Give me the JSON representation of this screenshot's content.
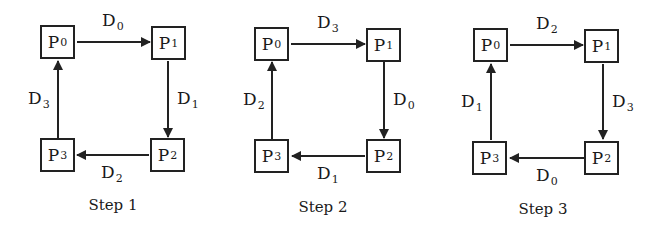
{
  "diagram": {
    "node_labels": [
      "P",
      "P",
      "P",
      "P"
    ],
    "panels": [
      {
        "caption": "Step 1",
        "nodes": [
          {
            "name": "P",
            "sub": "0"
          },
          {
            "name": "P",
            "sub": "1"
          },
          {
            "name": "P",
            "sub": "2"
          },
          {
            "name": "P",
            "sub": "3"
          }
        ],
        "edges": {
          "top": {
            "from": "P0",
            "to": "P1",
            "label": "D",
            "sub": "0"
          },
          "right": {
            "from": "P1",
            "to": "P2",
            "label": "D",
            "sub": "1"
          },
          "bottom": {
            "from": "P2",
            "to": "P3",
            "label": "D",
            "sub": "2"
          },
          "left": {
            "from": "P3",
            "to": "P0",
            "label": "D",
            "sub": "3"
          }
        }
      },
      {
        "caption": "Step 2",
        "nodes": [
          {
            "name": "P",
            "sub": "0"
          },
          {
            "name": "P",
            "sub": "1"
          },
          {
            "name": "P",
            "sub": "2"
          },
          {
            "name": "P",
            "sub": "3"
          }
        ],
        "edges": {
          "top": {
            "from": "P0",
            "to": "P1",
            "label": "D",
            "sub": "3"
          },
          "right": {
            "from": "P1",
            "to": "P2",
            "label": "D",
            "sub": "0"
          },
          "bottom": {
            "from": "P2",
            "to": "P3",
            "label": "D",
            "sub": "1"
          },
          "left": {
            "from": "P3",
            "to": "P0",
            "label": "D",
            "sub": "2"
          }
        }
      },
      {
        "caption": "Step 3",
        "nodes": [
          {
            "name": "P",
            "sub": "0"
          },
          {
            "name": "P",
            "sub": "1"
          },
          {
            "name": "P",
            "sub": "2"
          },
          {
            "name": "P",
            "sub": "3"
          }
        ],
        "edges": {
          "top": {
            "from": "P0",
            "to": "P1",
            "label": "D",
            "sub": "2"
          },
          "right": {
            "from": "P1",
            "to": "P2",
            "label": "D",
            "sub": "3"
          },
          "bottom": {
            "from": "P2",
            "to": "P3",
            "label": "D",
            "sub": "0"
          },
          "left": {
            "from": "P3",
            "to": "P0",
            "label": "D",
            "sub": "1"
          }
        }
      }
    ],
    "colors": {
      "stroke": "#222222",
      "background": "#ffffff",
      "text": "#1a1a1a"
    }
  }
}
